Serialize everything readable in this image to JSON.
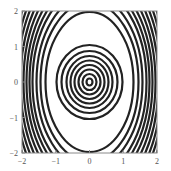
{
  "chart_data": {
    "type": "contour",
    "title": "",
    "xlabel": "",
    "ylabel": "",
    "xlim": [
      -2,
      2
    ],
    "ylim": [
      -2,
      2
    ],
    "grid": false,
    "legend": null,
    "xticks": [
      -2,
      -1,
      0,
      1,
      2
    ],
    "yticks": [
      -2,
      -1,
      0,
      1,
      2
    ],
    "xtick_labels": [
      "−2",
      "−1",
      "0",
      "1",
      "2"
    ],
    "ytick_labels": [
      "2",
      "1",
      "0",
      "−1",
      "−2"
    ],
    "center": [
      0,
      0
    ],
    "inner_contours_semi_axes": [
      {
        "a": 0.09,
        "b": 0.1
      },
      {
        "a": 0.21,
        "b": 0.23
      },
      {
        "a": 0.33,
        "b": 0.35
      },
      {
        "a": 0.45,
        "b": 0.48
      },
      {
        "a": 0.57,
        "b": 0.61
      },
      {
        "a": 0.69,
        "b": 0.73
      },
      {
        "a": 0.84,
        "b": 0.87
      },
      {
        "a": 0.99,
        "b": 1.04
      }
    ],
    "large_contour_semi_axes": {
      "a": 1.31,
      "b": 1.97
    },
    "outer_contour_a_values": [
      1.46,
      1.58,
      1.7,
      1.79,
      1.88,
      1.97,
      2.06,
      2.15,
      2.24,
      2.33,
      2.42,
      2.51,
      2.6,
      2.69
    ],
    "line_color": "#222222",
    "axes_color": "#888888"
  },
  "plot": {
    "box": {
      "left": 22,
      "top": 11,
      "right": 157,
      "bottom": 153
    },
    "center_px": [
      89.5,
      82
    ],
    "inner_px": [
      [
        3,
        3.5
      ],
      [
        7,
        8
      ],
      [
        11,
        12.5
      ],
      [
        15,
        17
      ],
      [
        19,
        21.5
      ],
      [
        23,
        26
      ],
      [
        28,
        31
      ],
      [
        33,
        37
      ]
    ],
    "large_px": [
      44,
      70
    ],
    "outer_px_a": [
      49,
      53,
      57,
      60,
      63,
      66,
      69,
      72,
      75,
      78,
      81,
      84,
      87,
      90
    ],
    "outer_ratio": 1.62,
    "stroke": "#222222",
    "stroke_width": 2.2,
    "axis_color": "#8a8a8a"
  }
}
